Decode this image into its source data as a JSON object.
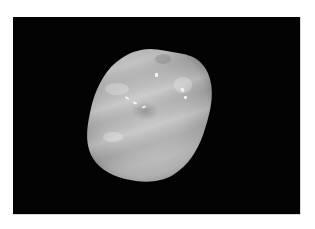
{
  "image": {
    "subject": "tooth",
    "view": "occlusal",
    "background_color": "#030303",
    "page_background": "#ffffff",
    "object_tone": "grayscale"
  }
}
